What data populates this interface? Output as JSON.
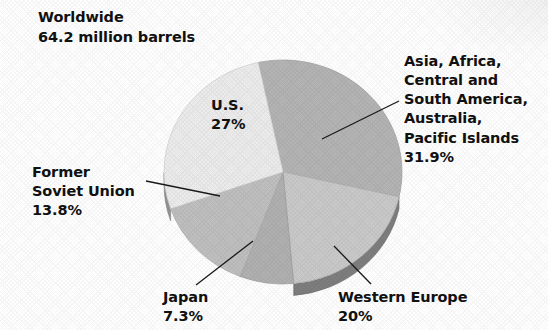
{
  "title": {
    "line1": "Worldwide",
    "line2": "64.2 million barrels"
  },
  "labels": {
    "asia": "Asia, Africa,\nCentral and\nSouth America,\nAustralia,\nPacific Islands\n31.9%",
    "former_soviet_union": "Former\nSoviet Union\n13.8%",
    "us": "U.S.\n27%",
    "japan": "Japan\n7.3%",
    "western_europe": "Western Europe\n20%"
  },
  "chart_data": {
    "type": "pie",
    "subtitle": "",
    "unit": "million barrels",
    "total": 64.2,
    "xlabel": "",
    "ylabel": "",
    "legend_position": "none",
    "grid": false,
    "three_d": true,
    "categories": [
      "Asia, Africa, Central and South America, Australia, Pacific Islands",
      "Western Europe",
      "Japan",
      "Former Soviet Union",
      "U.S."
    ],
    "values": [
      31.9,
      20,
      7.3,
      13.8,
      27
    ],
    "value_labels": [
      "31.9%",
      "20%",
      "7.3%",
      "13.8%",
      "27%"
    ],
    "colors": [
      "#b6b6b6",
      "#cbcbcb",
      "#b2b2b2",
      "#c1c1c1",
      "#eeeeee"
    ],
    "slices": [
      {
        "name": "Asia, Africa, Central and South America, Australia, Pacific Islands",
        "value": 31.9,
        "label": "31.9%",
        "color": "#b6b6b6",
        "start_angle": 0,
        "end_angle": 114.84
      },
      {
        "name": "Western Europe",
        "value": 20,
        "label": "20%",
        "color": "#cbcbcb",
        "start_angle": 114.84,
        "end_angle": 186.84
      },
      {
        "name": "Japan",
        "value": 7.3,
        "label": "7.3%",
        "color": "#b2b2b2",
        "start_angle": 186.84,
        "end_angle": 213.12
      },
      {
        "name": "Former Soviet Union",
        "value": 13.8,
        "label": "13.8%",
        "color": "#c1c1c1",
        "start_angle": 213.12,
        "end_angle": 262.8
      },
      {
        "name": "U.S.",
        "value": 27,
        "label": "27%",
        "color": "#eeeeee",
        "start_angle": 262.8,
        "end_angle": 360
      }
    ]
  },
  "geometry": {
    "cx": 283,
    "cy": 172,
    "rx": 119,
    "ry": 112,
    "depth": 12,
    "rotation_deg": -12
  },
  "colors": {
    "text": "#111111",
    "leader_line": "#1a1a1a",
    "background": "#ffffff",
    "rim_dark": "#8a8a8a",
    "rim_darker": "#6e6e6e"
  }
}
